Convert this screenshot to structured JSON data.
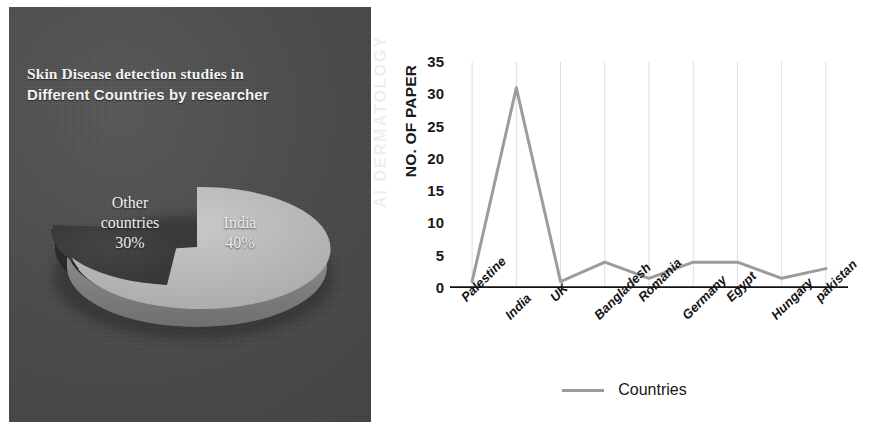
{
  "pie": {
    "title_line1": "Skin Disease detection studies in",
    "title_line2": "Different Countries by researcher",
    "panel_background": "#4a4a4a",
    "slice_india_color": "#b9b9b9",
    "slice_other_color": "#3b3b3b",
    "labels": {
      "other_name": "Other",
      "other_name2": "countries",
      "other_value": "30%",
      "india_name": "India",
      "india_value": "40%"
    }
  },
  "line": {
    "y_axis_title": "NO. OF PAPER",
    "watermark": "AI DERMATOLOGY",
    "legend_label": "Countries",
    "legend_color": "#9c9c9c"
  },
  "chart_data": [
    {
      "type": "pie",
      "title": "Skin Disease detection studies in Different Countries by researcher",
      "categories": [
        "India",
        "Other countries"
      ],
      "values": [
        40,
        30
      ],
      "value_labels": [
        "40%",
        "30%"
      ],
      "colors": [
        "#b9b9b9",
        "#3b3b3b"
      ],
      "exploded": [
        "Other countries"
      ],
      "three_d": true,
      "legend": "none"
    },
    {
      "type": "line",
      "title": "",
      "xlabel": "",
      "ylabel": "NO. OF PAPER",
      "categories": [
        "Palestine",
        "India",
        "UK",
        "Bangladesh",
        "Romania",
        "Germany",
        "Egypt",
        "Hungary",
        "pakistan"
      ],
      "series": [
        {
          "name": "Countries",
          "values": [
            1,
            31,
            1,
            4,
            1.5,
            4,
            4,
            1.5,
            3
          ],
          "color": "#9c9c9c"
        }
      ],
      "ylim": [
        0,
        35
      ],
      "yticks": [
        0,
        5,
        10,
        15,
        20,
        25,
        30,
        35
      ],
      "grid": "vertical-faint",
      "legend_position": "bottom"
    }
  ]
}
